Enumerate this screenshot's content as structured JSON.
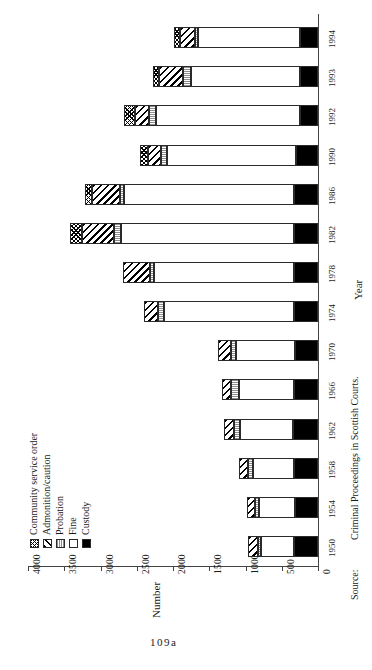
{
  "figure": {
    "page_number": "109a",
    "source_label": "Source:",
    "source_text": "Criminal Proceedings in Scottish Courts.",
    "orientation": "rotated-90"
  },
  "axes": {
    "value_axis": {
      "title": "Number",
      "ticks": [
        "4000",
        "3500",
        "3000",
        "2500",
        "2000",
        "1500",
        "1000",
        "500",
        "0"
      ],
      "min": 0,
      "max": 4000
    },
    "category_axis": {
      "title": "Year",
      "ticks": [
        "1950",
        "1954",
        "1958",
        "1962",
        "1966",
        "1970",
        "1974",
        "1978",
        "1982",
        "1986",
        "1990",
        "1992",
        "1993",
        "1994"
      ]
    }
  },
  "legend": {
    "position": "left",
    "items": [
      {
        "label": "Community service order",
        "swatch": "cso",
        "pattern": "checkered-dots"
      },
      {
        "label": "Admonition/caution",
        "swatch": "admon",
        "pattern": "diagonal-hatch"
      },
      {
        "label": "Probation",
        "swatch": "probation",
        "pattern": "light-gray-lines"
      },
      {
        "label": "Fine",
        "swatch": "fine",
        "pattern": "white"
      },
      {
        "label": "Custody",
        "swatch": "custody",
        "pattern": "solid-black"
      }
    ]
  },
  "chart_data": {
    "type": "bar",
    "subtype": "stacked-horizontal",
    "title": "",
    "xlabel": "Year",
    "ylabel": "Number",
    "ylim": [
      0,
      4000
    ],
    "grid": false,
    "legend_position": "left",
    "categories": [
      "1950",
      "1954",
      "1958",
      "1962",
      "1966",
      "1970",
      "1974",
      "1978",
      "1982",
      "1986",
      "1990",
      "1992",
      "1993",
      "1994"
    ],
    "series": [
      {
        "name": "Custody",
        "values": [
          330,
          320,
          330,
          350,
          330,
          320,
          330,
          330,
          330,
          330,
          300,
          250,
          250,
          250
        ]
      },
      {
        "name": "Fine",
        "values": [
          460,
          490,
          560,
          730,
          760,
          810,
          1790,
          1930,
          2390,
          2340,
          1780,
          1980,
          1500,
          1400
        ]
      },
      {
        "name": "Probation",
        "values": [
          40,
          60,
          80,
          80,
          110,
          70,
          90,
          60,
          100,
          60,
          80,
          100,
          110,
          50
        ]
      },
      {
        "name": "Admonition/caution",
        "values": [
          130,
          110,
          120,
          130,
          130,
          180,
          190,
          370,
          440,
          390,
          190,
          200,
          330,
          210
        ]
      },
      {
        "name": "Community service order",
        "values": [
          0,
          0,
          0,
          0,
          0,
          0,
          0,
          0,
          160,
          90,
          110,
          150,
          90,
          80
        ]
      }
    ],
    "totals": [
      960,
      980,
      1090,
      1290,
      1330,
      1380,
      2400,
      2690,
      3420,
      3210,
      2460,
      2680,
      2280,
      1990
    ]
  }
}
